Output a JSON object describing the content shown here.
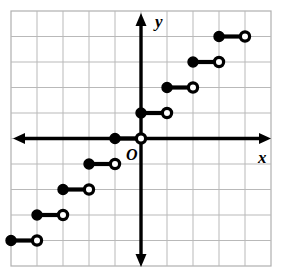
{
  "figure": {
    "name": "step-function-graph",
    "width": 291,
    "height": 280,
    "background_color": "#ffffff"
  },
  "chart_data": {
    "type": "line",
    "subtype": "step-function",
    "title": "",
    "xlabel": "x",
    "ylabel": "y",
    "xlim": [
      -5,
      5
    ],
    "ylim": [
      -5,
      5
    ],
    "grid": true,
    "grid_color": "#b9b9b9",
    "grid_step": 1,
    "axis_color": "#000000",
    "curve_color": "#000000",
    "origin_label": "O",
    "legend": "none",
    "x_tick_labels": [],
    "y_tick_labels": [],
    "segments": [
      {
        "x_start": -5,
        "x_end": -4,
        "y": -4,
        "left_endpoint": "closed",
        "right_endpoint": "open"
      },
      {
        "x_start": -4,
        "x_end": -3,
        "y": -3,
        "left_endpoint": "closed",
        "right_endpoint": "open"
      },
      {
        "x_start": -3,
        "x_end": -2,
        "y": -2,
        "left_endpoint": "closed",
        "right_endpoint": "open"
      },
      {
        "x_start": -2,
        "x_end": -1,
        "y": -1,
        "left_endpoint": "closed",
        "right_endpoint": "open"
      },
      {
        "x_start": -1,
        "x_end": 0,
        "y": 0,
        "left_endpoint": "closed",
        "right_endpoint": "open"
      },
      {
        "x_start": 0,
        "x_end": 1,
        "y": 1,
        "left_endpoint": "closed",
        "right_endpoint": "open"
      },
      {
        "x_start": 1,
        "x_end": 2,
        "y": 2,
        "left_endpoint": "closed",
        "right_endpoint": "open"
      },
      {
        "x_start": 2,
        "x_end": 3,
        "y": 3,
        "left_endpoint": "closed",
        "right_endpoint": "open"
      },
      {
        "x_start": 3,
        "x_end": 4,
        "y": 4,
        "left_endpoint": "closed",
        "right_endpoint": "open"
      }
    ]
  },
  "labels": {
    "x_axis": "x",
    "y_axis": "y",
    "origin": "O"
  }
}
